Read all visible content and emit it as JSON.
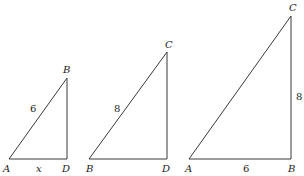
{
  "diagram": {
    "type": "similar-right-triangles",
    "triangles": [
      {
        "name": "triangle-ABD",
        "vertices": {
          "A": "A",
          "B": "B",
          "D": "D"
        },
        "side_labels": {
          "hypotenuse_AB": "6",
          "base_AD": "x"
        }
      },
      {
        "name": "triangle-BCD",
        "vertices": {
          "B": "B",
          "C": "C",
          "D": "D"
        },
        "side_labels": {
          "hypotenuse_BC": "8"
        }
      },
      {
        "name": "triangle-ABC",
        "vertices": {
          "A": "A",
          "B": "B",
          "C": "C"
        },
        "side_labels": {
          "base_AB": "6",
          "leg_BC": "8"
        }
      }
    ]
  }
}
